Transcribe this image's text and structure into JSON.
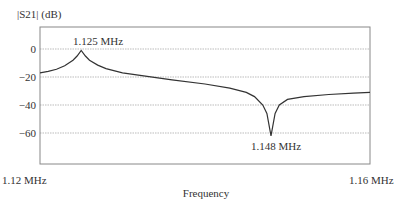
{
  "chart_data": {
    "type": "line",
    "title": "",
    "xlabel": "Frequency",
    "ylabel": "|S21| (dB)",
    "xlim": [
      1.12,
      1.16
    ],
    "ylim": [
      -80,
      16
    ],
    "x_tick_labels": [
      "1.12 MHz",
      "1.16 MHz"
    ],
    "y_ticks": [
      0,
      -20,
      -40,
      -60
    ],
    "y_tick_labels": [
      "0",
      "−20",
      "−40",
      "−60"
    ],
    "grid": "horizontal dotted",
    "annotations": [
      {
        "text": "1.125 MHz",
        "x": 1.125,
        "y": 0,
        "position": "above"
      },
      {
        "text": "1.148 MHz",
        "x": 1.148,
        "y": -62,
        "position": "below"
      }
    ],
    "series": [
      {
        "name": "|S21|",
        "x": [
          1.12,
          1.121,
          1.122,
          1.123,
          1.124,
          1.1245,
          1.125,
          1.1255,
          1.126,
          1.127,
          1.128,
          1.13,
          1.133,
          1.136,
          1.14,
          1.143,
          1.145,
          1.146,
          1.147,
          1.1475,
          1.148,
          1.1485,
          1.149,
          1.15,
          1.152,
          1.155,
          1.158,
          1.16
        ],
        "values": [
          -17,
          -16,
          -14.5,
          -12,
          -8,
          -5,
          -1,
          -5,
          -8,
          -11.5,
          -14,
          -17,
          -19.5,
          -22,
          -25,
          -28,
          -31,
          -34,
          -40,
          -46,
          -62,
          -46,
          -40,
          -36,
          -34,
          -32.5,
          -31.5,
          -31
        ]
      }
    ]
  }
}
